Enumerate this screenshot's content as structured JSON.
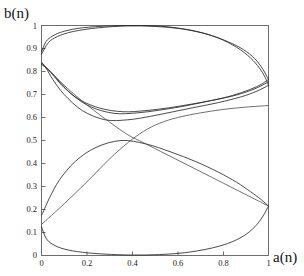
{
  "chart_data": {
    "type": "line",
    "title": "",
    "subtitle": "",
    "xlabel": "a(n)",
    "ylabel": "b(n)",
    "xlim": [
      0,
      1
    ],
    "ylim": [
      0,
      1
    ],
    "grid": false,
    "legend": "none",
    "xticks": [
      0,
      0.2,
      0.4,
      0.6,
      0.8,
      1
    ],
    "xticklabels": [
      "0",
      "0.2",
      "0.4",
      "0.6",
      "0.8",
      "1"
    ],
    "yticks": [
      0,
      0.1,
      0.2,
      0.3,
      0.4,
      0.5,
      0.6,
      0.7,
      0.8,
      0.9,
      1
    ],
    "yticklabels": [
      "0",
      "0.1",
      "0.2",
      "0.3",
      "0.4",
      "0.5",
      "0.6",
      "0.7",
      "0.8",
      "0.9",
      "1"
    ],
    "line_color": "#2b2b2b",
    "axis_color": "#6d6d6d",
    "series": [
      {
        "name": "upper-lobe-outer",
        "points": [
          [
            0.0,
            0.885
          ],
          [
            0.02,
            0.93
          ],
          [
            0.05,
            0.955
          ],
          [
            0.1,
            0.975
          ],
          [
            0.18,
            0.99
          ],
          [
            0.3,
            0.998
          ],
          [
            0.42,
            1.0
          ],
          [
            0.55,
            0.995
          ],
          [
            0.68,
            0.975
          ],
          [
            0.78,
            0.945
          ],
          [
            0.86,
            0.905
          ],
          [
            0.92,
            0.86
          ],
          [
            0.96,
            0.815
          ],
          [
            0.985,
            0.775
          ],
          [
            1.0,
            0.74
          ]
        ]
      },
      {
        "name": "upper-lobe-inner-return",
        "points": [
          [
            1.0,
            0.74
          ],
          [
            0.95,
            0.715
          ],
          [
            0.88,
            0.69
          ],
          [
            0.78,
            0.665
          ],
          [
            0.68,
            0.645
          ],
          [
            0.58,
            0.625
          ],
          [
            0.48,
            0.605
          ],
          [
            0.38,
            0.59
          ],
          [
            0.28,
            0.59
          ],
          [
            0.18,
            0.63
          ],
          [
            0.1,
            0.7
          ],
          [
            0.05,
            0.765
          ],
          [
            0.02,
            0.815
          ],
          [
            0.0,
            0.84
          ]
        ]
      },
      {
        "name": "upper-lobe-second-outer",
        "points": [
          [
            0.0,
            0.875
          ],
          [
            0.03,
            0.925
          ],
          [
            0.07,
            0.952
          ],
          [
            0.14,
            0.974
          ],
          [
            0.25,
            0.99
          ],
          [
            0.38,
            0.998
          ],
          [
            0.5,
            0.996
          ],
          [
            0.62,
            0.985
          ],
          [
            0.73,
            0.962
          ],
          [
            0.82,
            0.93
          ],
          [
            0.89,
            0.895
          ],
          [
            0.94,
            0.855
          ],
          [
            0.975,
            0.81
          ],
          [
            1.0,
            0.765
          ]
        ]
      },
      {
        "name": "upper-lobe-second-return",
        "points": [
          [
            1.0,
            0.765
          ],
          [
            0.96,
            0.74
          ],
          [
            0.9,
            0.715
          ],
          [
            0.82,
            0.69
          ],
          [
            0.72,
            0.668
          ],
          [
            0.62,
            0.648
          ],
          [
            0.52,
            0.632
          ],
          [
            0.42,
            0.62
          ],
          [
            0.32,
            0.618
          ],
          [
            0.22,
            0.645
          ],
          [
            0.14,
            0.695
          ],
          [
            0.08,
            0.755
          ],
          [
            0.035,
            0.805
          ],
          [
            0.0,
            0.83
          ]
        ]
      },
      {
        "name": "upper-lobe-third-return",
        "points": [
          [
            1.0,
            0.755
          ],
          [
            0.94,
            0.725
          ],
          [
            0.86,
            0.698
          ],
          [
            0.76,
            0.676
          ],
          [
            0.66,
            0.658
          ],
          [
            0.56,
            0.642
          ],
          [
            0.46,
            0.63
          ],
          [
            0.36,
            0.625
          ],
          [
            0.26,
            0.64
          ],
          [
            0.17,
            0.676
          ],
          [
            0.1,
            0.73
          ],
          [
            0.05,
            0.785
          ],
          [
            0.015,
            0.822
          ],
          [
            0.0,
            0.835
          ]
        ]
      },
      {
        "name": "lower-lobe-outer",
        "points": [
          [
            0.0,
            0.125
          ],
          [
            0.02,
            0.075
          ],
          [
            0.05,
            0.048
          ],
          [
            0.1,
            0.028
          ],
          [
            0.18,
            0.014
          ],
          [
            0.28,
            0.006
          ],
          [
            0.4,
            0.002
          ],
          [
            0.52,
            0.004
          ],
          [
            0.63,
            0.012
          ],
          [
            0.73,
            0.028
          ],
          [
            0.82,
            0.052
          ],
          [
            0.89,
            0.085
          ],
          [
            0.94,
            0.125
          ],
          [
            0.975,
            0.17
          ],
          [
            1.0,
            0.215
          ]
        ]
      },
      {
        "name": "lower-lobe-return",
        "points": [
          [
            1.0,
            0.215
          ],
          [
            0.965,
            0.245
          ],
          [
            0.92,
            0.278
          ],
          [
            0.86,
            0.318
          ],
          [
            0.78,
            0.362
          ],
          [
            0.68,
            0.408
          ],
          [
            0.57,
            0.45
          ],
          [
            0.46,
            0.485
          ],
          [
            0.35,
            0.5
          ],
          [
            0.24,
            0.47
          ],
          [
            0.15,
            0.41
          ],
          [
            0.08,
            0.33
          ],
          [
            0.035,
            0.25
          ],
          [
            0.01,
            0.195
          ],
          [
            0.0,
            0.175
          ]
        ]
      },
      {
        "name": "diagonal-descending",
        "points": [
          [
            0.0,
            0.84
          ],
          [
            0.1,
            0.74
          ],
          [
            0.2,
            0.655
          ],
          [
            0.3,
            0.58
          ],
          [
            0.38,
            0.525
          ],
          [
            0.45,
            0.49
          ],
          [
            0.55,
            0.44
          ],
          [
            0.65,
            0.39
          ],
          [
            0.75,
            0.34
          ],
          [
            0.85,
            0.29
          ],
          [
            0.93,
            0.25
          ],
          [
            1.0,
            0.215
          ]
        ]
      },
      {
        "name": "diagonal-ascending",
        "points": [
          [
            0.0,
            0.135
          ],
          [
            0.1,
            0.225
          ],
          [
            0.2,
            0.32
          ],
          [
            0.3,
            0.42
          ],
          [
            0.38,
            0.49
          ],
          [
            0.45,
            0.54
          ],
          [
            0.52,
            0.575
          ],
          [
            0.6,
            0.6
          ],
          [
            0.7,
            0.62
          ],
          [
            0.8,
            0.635
          ],
          [
            0.9,
            0.645
          ],
          [
            1.0,
            0.652
          ]
        ]
      }
    ],
    "features": {
      "crossing_point": [
        0.4,
        0.5
      ],
      "description": "Two lens-shaped lobes (upper and lower) with intersecting diagonal branches forming an X near the center"
    }
  },
  "axis_labels": {
    "y": "b(n)",
    "x": "a(n)"
  }
}
